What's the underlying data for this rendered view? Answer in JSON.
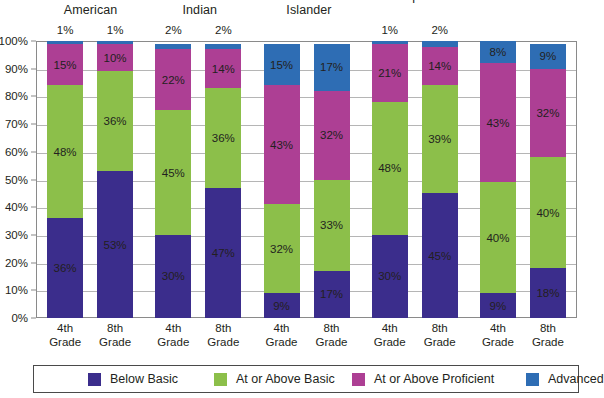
{
  "chart_data": {
    "type": "bar",
    "subtype": "stacked-bar-100",
    "title": "",
    "xlabel": "",
    "ylabel": "",
    "ylim": [
      0,
      100
    ],
    "ytick_labels": [
      "0%",
      "10%",
      "20%",
      "30%",
      "40%",
      "50%",
      "60%",
      "70%",
      "80%",
      "90%",
      "100%"
    ],
    "ytick_values": [
      0,
      10,
      20,
      30,
      40,
      50,
      60,
      70,
      80,
      90,
      100
    ],
    "grid": true,
    "legend_position": "bottom",
    "groups": [
      {
        "name": "African American",
        "name_lines": [
          "African",
          "American"
        ]
      },
      {
        "name": "American Indian",
        "name_lines": [
          "American",
          "Indian"
        ]
      },
      {
        "name": "Asian/Pacific Islander",
        "name_lines": [
          "Asian/Pacific",
          "Islander"
        ]
      },
      {
        "name": "Hispanic",
        "name_lines": [
          "Hispanic",
          ""
        ]
      },
      {
        "name": "White",
        "name_lines": [
          "White",
          ""
        ]
      }
    ],
    "categories": [
      "African American 4th Grade",
      "African American 8th Grade",
      "American Indian 4th Grade",
      "American Indian 8th Grade",
      "Asian/Pacific Islander 4th Grade",
      "Asian/Pacific Islander 8th Grade",
      "Hispanic 4th Grade",
      "Hispanic 8th Grade",
      "White 4th Grade",
      "White 8th Grade"
    ],
    "tick_labels": [
      [
        "4th",
        "Grade"
      ],
      [
        "8th",
        "Grade"
      ],
      [
        "4th",
        "Grade"
      ],
      [
        "8th",
        "Grade"
      ],
      [
        "4th",
        "Grade"
      ],
      [
        "8th",
        "Grade"
      ],
      [
        "4th",
        "Grade"
      ],
      [
        "8th",
        "Grade"
      ],
      [
        "4th",
        "Grade"
      ],
      [
        "8th",
        "Grade"
      ]
    ],
    "series": [
      {
        "name": "Below Basic",
        "color": "#3b2d8c",
        "values": [
          36,
          53,
          30,
          47,
          9,
          17,
          30,
          45,
          9,
          18
        ]
      },
      {
        "name": "At or Above Basic",
        "color": "#8cbf4a",
        "values": [
          48,
          36,
          45,
          36,
          32,
          33,
          48,
          39,
          40,
          40
        ]
      },
      {
        "name": "At or Above Proficient",
        "color": "#ad3f94",
        "values": [
          15,
          10,
          22,
          14,
          43,
          32,
          21,
          14,
          43,
          32
        ]
      },
      {
        "name": "Advanced",
        "color": "#2e6db4",
        "values": [
          1,
          1,
          2,
          2,
          15,
          17,
          1,
          2,
          8,
          9
        ]
      }
    ],
    "value_labels": [
      {
        "bar": 0,
        "series": 0,
        "text": "36%"
      },
      {
        "bar": 0,
        "series": 1,
        "text": "48%"
      },
      {
        "bar": 0,
        "series": 2,
        "text": "15%"
      },
      {
        "bar": 0,
        "series": 3,
        "text": "1%",
        "outside": true
      },
      {
        "bar": 1,
        "series": 0,
        "text": "53%"
      },
      {
        "bar": 1,
        "series": 1,
        "text": "36%"
      },
      {
        "bar": 1,
        "series": 2,
        "text": "10%"
      },
      {
        "bar": 1,
        "series": 3,
        "text": "1%",
        "outside": true
      },
      {
        "bar": 2,
        "series": 0,
        "text": "30%"
      },
      {
        "bar": 2,
        "series": 1,
        "text": "45%"
      },
      {
        "bar": 2,
        "series": 2,
        "text": "22%"
      },
      {
        "bar": 2,
        "series": 3,
        "text": "2%",
        "outside": true
      },
      {
        "bar": 3,
        "series": 0,
        "text": "47%"
      },
      {
        "bar": 3,
        "series": 1,
        "text": "36%"
      },
      {
        "bar": 3,
        "series": 2,
        "text": "14%"
      },
      {
        "bar": 3,
        "series": 3,
        "text": "2%",
        "outside": true
      },
      {
        "bar": 4,
        "series": 0,
        "text": "9%"
      },
      {
        "bar": 4,
        "series": 1,
        "text": "32%"
      },
      {
        "bar": 4,
        "series": 2,
        "text": "43%"
      },
      {
        "bar": 4,
        "series": 3,
        "text": "15%"
      },
      {
        "bar": 5,
        "series": 0,
        "text": "17%"
      },
      {
        "bar": 5,
        "series": 1,
        "text": "33%"
      },
      {
        "bar": 5,
        "series": 2,
        "text": "32%"
      },
      {
        "bar": 5,
        "series": 3,
        "text": "17%"
      },
      {
        "bar": 6,
        "series": 0,
        "text": "30%"
      },
      {
        "bar": 6,
        "series": 1,
        "text": "48%"
      },
      {
        "bar": 6,
        "series": 2,
        "text": "21%"
      },
      {
        "bar": 6,
        "series": 3,
        "text": "1%",
        "outside": true
      },
      {
        "bar": 7,
        "series": 0,
        "text": "45%"
      },
      {
        "bar": 7,
        "series": 1,
        "text": "39%"
      },
      {
        "bar": 7,
        "series": 2,
        "text": "14%"
      },
      {
        "bar": 7,
        "series": 3,
        "text": "2%",
        "outside": true
      },
      {
        "bar": 8,
        "series": 0,
        "text": "9%"
      },
      {
        "bar": 8,
        "series": 1,
        "text": "40%"
      },
      {
        "bar": 8,
        "series": 2,
        "text": "43%"
      },
      {
        "bar": 8,
        "series": 3,
        "text": "8%"
      },
      {
        "bar": 9,
        "series": 0,
        "text": "18%"
      },
      {
        "bar": 9,
        "series": 1,
        "text": "40%"
      },
      {
        "bar": 9,
        "series": 2,
        "text": "32%"
      },
      {
        "bar": 9,
        "series": 3,
        "text": "9%"
      }
    ],
    "legend": [
      {
        "label": "Below Basic",
        "color": "#3b2d8c"
      },
      {
        "label": "At or Above Basic",
        "color": "#8cbf4a"
      },
      {
        "label": "At or Above Proficient",
        "color": "#ad3f94"
      },
      {
        "label": "Advanced",
        "color": "#2e6db4"
      }
    ]
  },
  "colors": {
    "below_basic": "#3b2d8c",
    "at_or_above_basic": "#8cbf4a",
    "at_or_above_proficient": "#ad3f94",
    "advanced": "#2e6db4",
    "axis": "#8a8a8a",
    "gridline": "#b5b5b5",
    "text": "#231f20"
  }
}
